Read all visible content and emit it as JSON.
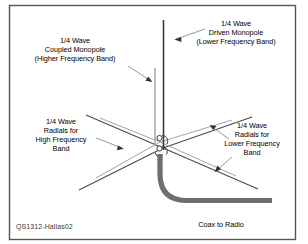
{
  "figure": {
    "caption": "QS1312-Hallas02",
    "frame_color": "#555555",
    "background_color": "#ffffff"
  },
  "labels": {
    "coupled_monopole": "1/4 Wave\nCoupled Monopole\n(Higher Frequency Band)",
    "driven_monopole": "1/4 Wave\nDriven Monopole\n(Lower Frequency Band)",
    "radials_high": "1/4 Wave\nRadials for\nHigh Frequency\nBand",
    "radials_low": "1/4 Wave\nRadials for\nLower Frequency\nBand",
    "coax": "Coax to Radio"
  },
  "elements": {
    "driven_monopole_color": "#3c3c3c",
    "coupled_monopole_color": "#9a9a9a",
    "radial_dark_color": "#4a4a4a",
    "radial_light_color": "#a5a5a5",
    "coax_color": "#6e6e6e",
    "leader_color": "#8c8c8c",
    "arrow_color": "#333333",
    "hub_color": "#3c3c3c"
  }
}
